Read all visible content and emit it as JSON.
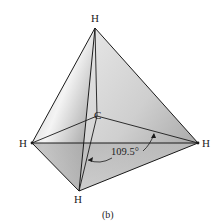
{
  "diagram": {
    "atoms": {
      "top": "H",
      "left": "H",
      "right": "H",
      "bottom": "H",
      "center": "C"
    },
    "angle_label": "109.5°",
    "caption": "(b)",
    "colors": {
      "edge": "#1a1a1a",
      "face_light": "#f2f2f2",
      "face_dark": "#8a8a8a",
      "text": "#222222"
    }
  }
}
